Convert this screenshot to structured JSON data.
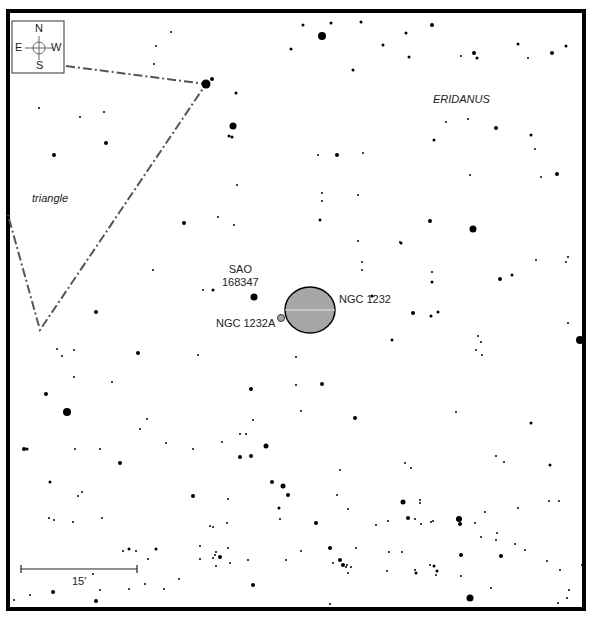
{
  "chart_data": {
    "type": "star-chart",
    "title": "",
    "frame": {
      "x": 8,
      "y": 11,
      "width": 576,
      "height": 598,
      "stroke": "#000000",
      "stroke_width": 4
    },
    "compass": {
      "x": 12,
      "y": 21,
      "size": 52,
      "labels": {
        "n": "N",
        "s": "S",
        "e": "E",
        "w": "W"
      }
    },
    "constellation_labels": [
      {
        "text": "ERIDANUS",
        "x": 433,
        "y": 93
      },
      {
        "text": "triangle",
        "x": 32,
        "y": 192
      }
    ],
    "objects": [
      {
        "name": "NGC 1232",
        "type": "galaxy",
        "cx": 310,
        "cy": 310,
        "rx": 25,
        "ry": 23,
        "fill": "#a6a6a6",
        "label_x": 339,
        "label_y": 293
      },
      {
        "name": "NGC 1232A",
        "type": "galaxy",
        "cx": 281,
        "cy": 318,
        "r": 3.5,
        "fill": "#a6a6a6",
        "label_x": 216,
        "label_y": 317
      },
      {
        "name": "SAO 168347",
        "type": "star",
        "cx": 254,
        "cy": 297,
        "r": 3.5,
        "label_line1": "SAO",
        "label_line2": "168347",
        "label_x": 240,
        "label_y": 263
      }
    ],
    "asterism_lines": [
      {
        "name": "triangle",
        "points": [
          [
            66,
            66
          ],
          [
            206,
            84
          ],
          [
            40,
            330
          ],
          [
            8,
            215
          ]
        ],
        "stroke": "#555555"
      }
    ],
    "scale_bar": {
      "x1": 21,
      "x2": 137,
      "y": 569,
      "label": "15'",
      "label_x": 72,
      "label_y": 575
    },
    "stars": [
      [
        206,
        84,
        4.5
      ],
      [
        212,
        79,
        2
      ],
      [
        233,
        126,
        3.5
      ],
      [
        229,
        136,
        1.5
      ],
      [
        232,
        137,
        1.5
      ],
      [
        154,
        64,
        1
      ],
      [
        156,
        46,
        1
      ],
      [
        171,
        32,
        1
      ],
      [
        322,
        36,
        4
      ],
      [
        303,
        25,
        1.5
      ],
      [
        331,
        23,
        1.5
      ],
      [
        361,
        22,
        1.5
      ],
      [
        291,
        49,
        1.5
      ],
      [
        353,
        70,
        1.5
      ],
      [
        236,
        93,
        1.5
      ],
      [
        432,
        25,
        2
      ],
      [
        406,
        33,
        1.5
      ],
      [
        409,
        57,
        1.5
      ],
      [
        383,
        45,
        1.5
      ],
      [
        477,
        58,
        1.5
      ],
      [
        518,
        44,
        1.5
      ],
      [
        552,
        53,
        2
      ],
      [
        566,
        46,
        1.5
      ],
      [
        474,
        53,
        2
      ],
      [
        528,
        58,
        1
      ],
      [
        461,
        56,
        1
      ],
      [
        468,
        119,
        1
      ],
      [
        496,
        128,
        2
      ],
      [
        446,
        122,
        1
      ],
      [
        434,
        140,
        1.5
      ],
      [
        531,
        135,
        1.5
      ],
      [
        535,
        149,
        1
      ],
      [
        557,
        174,
        2
      ],
      [
        470,
        175,
        1
      ],
      [
        541,
        177,
        1
      ],
      [
        318,
        155,
        1
      ],
      [
        337,
        155,
        2
      ],
      [
        363,
        153,
        1
      ],
      [
        39,
        108,
        1
      ],
      [
        80,
        117,
        1
      ],
      [
        104,
        112,
        1
      ],
      [
        106,
        143,
        2
      ],
      [
        54,
        155,
        2
      ],
      [
        237,
        185,
        1
      ],
      [
        218,
        217,
        1
      ],
      [
        234,
        225,
        1
      ],
      [
        184,
        223,
        2
      ],
      [
        322,
        193,
        1
      ],
      [
        320,
        220,
        1.5
      ],
      [
        322,
        201,
        1
      ],
      [
        358,
        195,
        1
      ],
      [
        358,
        241,
        1
      ],
      [
        400,
        242,
        1
      ],
      [
        430,
        221,
        2
      ],
      [
        473,
        229,
        3.5
      ],
      [
        401,
        243,
        1.5
      ],
      [
        362,
        262,
        1
      ],
      [
        362,
        270,
        1
      ],
      [
        372,
        296,
        1.5
      ],
      [
        432,
        272,
        1
      ],
      [
        432,
        282,
        1.5
      ],
      [
        500,
        279,
        2
      ],
      [
        512,
        275,
        1.5
      ],
      [
        568,
        257,
        1
      ],
      [
        566,
        262,
        1
      ],
      [
        568,
        323,
        1
      ],
      [
        580,
        340,
        4
      ],
      [
        413,
        313,
        2
      ],
      [
        431,
        316,
        1.5
      ],
      [
        478,
        336,
        1
      ],
      [
        481,
        342,
        1
      ],
      [
        476,
        350,
        1
      ],
      [
        482,
        355,
        1
      ],
      [
        438,
        312,
        1.5
      ],
      [
        392,
        340,
        1.5
      ],
      [
        536,
        260,
        1
      ],
      [
        153,
        270,
        1
      ],
      [
        203,
        290,
        1
      ],
      [
        213,
        290,
        1.5
      ],
      [
        300,
        293,
        1
      ],
      [
        296,
        357,
        1
      ],
      [
        96,
        312,
        2
      ],
      [
        138,
        353,
        2
      ],
      [
        57,
        349,
        1
      ],
      [
        62,
        356,
        1
      ],
      [
        74,
        350,
        1
      ],
      [
        198,
        355,
        1
      ],
      [
        74,
        377,
        1
      ],
      [
        112,
        382,
        1
      ],
      [
        46,
        394,
        2
      ],
      [
        67,
        412,
        4
      ],
      [
        140,
        429,
        1
      ],
      [
        147,
        419,
        1
      ],
      [
        322,
        384,
        2
      ],
      [
        296,
        385,
        1
      ],
      [
        251,
        389,
        2
      ],
      [
        253,
        420,
        1
      ],
      [
        301,
        411,
        1
      ],
      [
        355,
        418,
        2
      ],
      [
        240,
        434,
        1
      ],
      [
        246,
        434,
        1
      ],
      [
        266,
        446,
        2.5
      ],
      [
        240,
        457,
        2
      ],
      [
        251,
        456,
        2
      ],
      [
        222,
        442,
        1
      ],
      [
        166,
        443,
        1
      ],
      [
        24,
        449,
        2
      ],
      [
        27,
        449,
        1.5
      ],
      [
        75,
        449,
        1
      ],
      [
        100,
        449,
        1
      ],
      [
        120,
        463,
        2
      ],
      [
        50,
        482,
        1.5
      ],
      [
        82,
        492,
        1
      ],
      [
        78,
        496,
        1
      ],
      [
        193,
        496,
        2
      ],
      [
        272,
        482,
        2
      ],
      [
        283,
        486,
        2.5
      ],
      [
        288,
        495,
        2
      ],
      [
        279,
        508,
        1.5
      ],
      [
        228,
        499,
        1
      ],
      [
        210,
        526,
        1
      ],
      [
        316,
        523,
        2
      ],
      [
        340,
        470,
        1
      ],
      [
        337,
        495,
        1
      ],
      [
        456,
        412,
        1
      ],
      [
        405,
        463,
        1
      ],
      [
        411,
        468,
        1
      ],
      [
        531,
        423,
        1.5
      ],
      [
        496,
        456,
        1
      ],
      [
        504,
        462,
        1
      ],
      [
        550,
        465,
        1.5
      ],
      [
        420,
        503,
        1
      ],
      [
        549,
        501,
        1
      ],
      [
        403,
        502,
        2.5
      ],
      [
        559,
        501,
        1
      ],
      [
        408,
        518,
        2
      ],
      [
        431,
        522,
        1
      ],
      [
        459,
        519,
        3
      ],
      [
        485,
        512,
        1
      ],
      [
        518,
        508,
        1
      ],
      [
        227,
        523,
        1
      ],
      [
        193,
        449,
        1
      ],
      [
        49,
        518,
        1
      ],
      [
        54,
        520,
        1
      ],
      [
        73,
        522,
        1
      ],
      [
        102,
        518,
        1
      ],
      [
        213,
        527,
        1
      ],
      [
        301,
        551,
        1
      ],
      [
        330,
        548,
        2
      ],
      [
        388,
        521,
        1
      ],
      [
        415,
        519,
        1
      ],
      [
        421,
        524,
        1
      ],
      [
        433,
        521,
        1
      ],
      [
        460,
        524,
        2
      ],
      [
        475,
        523,
        1
      ],
      [
        481,
        537,
        1
      ],
      [
        497,
        533,
        1
      ],
      [
        200,
        546,
        1
      ],
      [
        148,
        559,
        1
      ],
      [
        220,
        557,
        2
      ],
      [
        228,
        548,
        1
      ],
      [
        280,
        519,
        1
      ],
      [
        348,
        509,
        1
      ],
      [
        376,
        525,
        1
      ],
      [
        434,
        566,
        1.5
      ],
      [
        496,
        540,
        1
      ],
      [
        525,
        550,
        1
      ],
      [
        356,
        548,
        1
      ],
      [
        230,
        563,
        1
      ],
      [
        340,
        560,
        2
      ],
      [
        343,
        565,
        2
      ],
      [
        346,
        567,
        1
      ],
      [
        387,
        571,
        1
      ],
      [
        402,
        552,
        1
      ],
      [
        389,
        552,
        1
      ],
      [
        416,
        573,
        1.5
      ],
      [
        437,
        571,
        1.5
      ],
      [
        461,
        555,
        2
      ],
      [
        501,
        556,
        2
      ],
      [
        491,
        588,
        1
      ],
      [
        547,
        561,
        1
      ],
      [
        515,
        544,
        1
      ],
      [
        569,
        590,
        1
      ],
      [
        213,
        558,
        1
      ],
      [
        216,
        566,
        1
      ],
      [
        253,
        585,
        2
      ],
      [
        179,
        579,
        1
      ],
      [
        156,
        549,
        1.5
      ],
      [
        129,
        549,
        1.5
      ],
      [
        145,
        584,
        1
      ],
      [
        93,
        574,
        1
      ],
      [
        100,
        590,
        1
      ],
      [
        96,
        601,
        2
      ],
      [
        53,
        592,
        2
      ],
      [
        30,
        595,
        1
      ],
      [
        14,
        600,
        1
      ],
      [
        54,
        592,
        1
      ],
      [
        215,
        555,
        1
      ],
      [
        248,
        560,
        1
      ],
      [
        286,
        560,
        1
      ],
      [
        347,
        565,
        1
      ],
      [
        415,
        570,
        1
      ],
      [
        470,
        598,
        3.5
      ],
      [
        558,
        603,
        1
      ],
      [
        582,
        565,
        1
      ],
      [
        164,
        589,
        1
      ],
      [
        129,
        589,
        1
      ],
      [
        200,
        559,
        1
      ],
      [
        216,
        552,
        1
      ],
      [
        136,
        551,
        1
      ],
      [
        123,
        551,
        1
      ],
      [
        333,
        563,
        1
      ],
      [
        560,
        570,
        1
      ],
      [
        430,
        565,
        1
      ],
      [
        436,
        575,
        1
      ],
      [
        330,
        604,
        1
      ],
      [
        348,
        573,
        1
      ],
      [
        351,
        567,
        1
      ],
      [
        420,
        500,
        1
      ],
      [
        461,
        576,
        1
      ],
      [
        567,
        598,
        1
      ]
    ]
  }
}
